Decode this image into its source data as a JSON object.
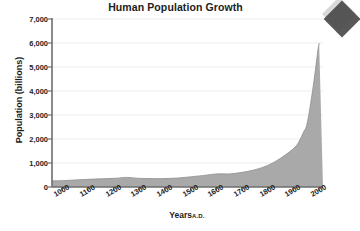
{
  "chart_data": {
    "type": "area",
    "title": "Human Population Growth",
    "xlabel": "Years",
    "xlabel_suffix": "A.D.",
    "ylabel": "Population (billions)",
    "xlim": [
      960,
      2015
    ],
    "ylim": [
      0,
      7000
    ],
    "grid": true,
    "grid_axis": "y",
    "legend": "none",
    "area_fill_color": "#a9a9a9",
    "area_line_color": "#8f8f8f",
    "axis_color": "#6e6e6e",
    "gridline_color": "#ededed",
    "background_color": "#ffffff",
    "x_tick_labels": [
      "1000",
      "1100",
      "1200",
      "1300",
      "1400",
      "1500",
      "1600",
      "1700",
      "1800",
      "1900",
      "2000"
    ],
    "x_ticks": [
      1000,
      1100,
      1200,
      1300,
      1400,
      1500,
      1600,
      1700,
      1800,
      1900,
      2000
    ],
    "y_tick_labels": [
      "0",
      "1,000",
      "2,000",
      "3,000",
      "4,000",
      "5,000",
      "6,000",
      "7,000"
    ],
    "y_ticks": [
      0,
      1000,
      2000,
      3000,
      4000,
      5000,
      6000,
      7000
    ],
    "x": [
      1000,
      1100,
      1200,
      1250,
      1300,
      1350,
      1400,
      1450,
      1500,
      1550,
      1600,
      1650,
      1700,
      1750,
      1800,
      1850,
      1900,
      1920,
      1940,
      1950,
      1960,
      1970,
      1980,
      1990,
      1995,
      2000
    ],
    "values": [
      265,
      320,
      360,
      400,
      360,
      350,
      350,
      375,
      425,
      480,
      545,
      545,
      610,
      720,
      900,
      1200,
      1600,
      1860,
      2300,
      2520,
      3020,
      3700,
      4430,
      5270,
      5700,
      6000
    ],
    "series": [
      {
        "name": "World population",
        "values": [
          265,
          320,
          360,
          400,
          360,
          350,
          350,
          375,
          425,
          480,
          545,
          545,
          610,
          720,
          900,
          1200,
          1600,
          1860,
          2300,
          2520,
          3020,
          3700,
          4430,
          5270,
          5700,
          6000
        ]
      }
    ]
  },
  "decoration": {
    "corner_arrow_color": "#4a4a4a"
  }
}
